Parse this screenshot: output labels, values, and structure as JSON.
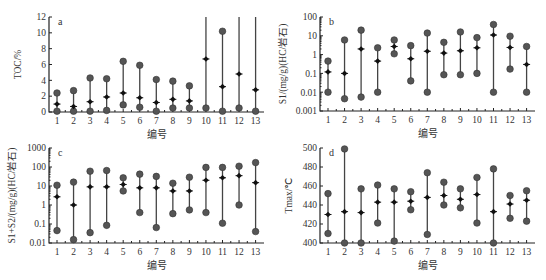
{
  "chart_data": [
    {
      "id": "a",
      "type": "range",
      "panel_letter": "a",
      "title": "",
      "xlabel": "编号",
      "ylabel": "TOC/%",
      "yscale": "linear",
      "ylim": [
        0,
        12
      ],
      "yticks": [
        0,
        2,
        4,
        6,
        8,
        10,
        12
      ],
      "ytick_labels": [
        "0",
        "2",
        "4",
        "6",
        "8",
        "10",
        "12"
      ],
      "categories": [
        "1",
        "2",
        "3",
        "4",
        "5",
        "6",
        "7",
        "8",
        "9",
        "10",
        "11",
        "12",
        "13"
      ],
      "series": [
        {
          "name": "min",
          "values": [
            0.1,
            0.1,
            0.1,
            0.2,
            0.9,
            0.6,
            0.1,
            0.5,
            0.5,
            0.5,
            0.1,
            0.5,
            0.1
          ]
        },
        {
          "name": "mean",
          "values": [
            1.0,
            0.7,
            1.3,
            1.9,
            2.4,
            1.8,
            1.2,
            1.6,
            1.4,
            6.7,
            3.2,
            4.8,
            2.8
          ]
        },
        {
          "name": "max",
          "values": [
            2.4,
            2.7,
            4.3,
            4.2,
            6.4,
            5.9,
            4.1,
            3.9,
            3.3,
            12,
            10.2,
            12,
            12
          ]
        }
      ],
      "grid": false,
      "legend": "none"
    },
    {
      "id": "b",
      "type": "range",
      "panel_letter": "b",
      "title": "",
      "xlabel": "编号",
      "ylabel": "S1/(mg/g)(HC/岩石)",
      "yscale": "log",
      "ylim": [
        0.001,
        100
      ],
      "yticks": [
        0.001,
        0.01,
        0.1,
        1,
        10,
        100
      ],
      "ytick_labels": [
        "0.001",
        "0.01",
        "0.1",
        "1",
        "10",
        "100"
      ],
      "categories": [
        "1",
        "2",
        "3",
        "4",
        "5",
        "6",
        "7",
        "8",
        "9",
        "10",
        "11",
        "12",
        "13"
      ],
      "series": [
        {
          "name": "min",
          "values": [
            0.01,
            0.0045,
            0.0055,
            0.01,
            1.1,
            0.04,
            0.01,
            0.085,
            0.085,
            0.1,
            0.01,
            0.17,
            0.01
          ]
        },
        {
          "name": "mean",
          "values": [
            0.12,
            0.1,
            2.0,
            0.45,
            2.7,
            0.6,
            1.5,
            1.2,
            1.6,
            2.3,
            11,
            2.4,
            0.3
          ]
        },
        {
          "name": "max",
          "values": [
            0.45,
            6.0,
            20,
            2.3,
            6.0,
            3.0,
            14,
            4.5,
            16,
            8.0,
            40,
            9.5,
            2.7
          ]
        }
      ],
      "grid": false,
      "legend": "none"
    },
    {
      "id": "c",
      "type": "range",
      "panel_letter": "c",
      "title": "",
      "xlabel": "编号",
      "ylabel": "S1+S2/(mg/g)(HC/岩石)",
      "yscale": "log",
      "ylim": [
        0.01,
        1000
      ],
      "yticks": [
        0.01,
        0.1,
        1,
        10,
        100,
        1000
      ],
      "ytick_labels": [
        "0.01",
        "0.1",
        "1",
        "10",
        "100",
        "1000"
      ],
      "categories": [
        "1",
        "2",
        "3",
        "4",
        "5",
        "6",
        "7",
        "8",
        "9",
        "10",
        "11",
        "12",
        "13"
      ],
      "series": [
        {
          "name": "min",
          "values": [
            0.045,
            0.015,
            0.035,
            0.085,
            5.5,
            0.4,
            0.065,
            0.35,
            0.55,
            0.4,
            0.11,
            1.0,
            0.04
          ]
        },
        {
          "name": "mean",
          "values": [
            2.7,
            1.0,
            9,
            9,
            12,
            8,
            8,
            5.5,
            5.5,
            20,
            27,
            35,
            15
          ]
        },
        {
          "name": "max",
          "values": [
            11,
            16,
            60,
            65,
            27,
            42,
            32,
            14,
            29,
            95,
            95,
            110,
            170
          ]
        }
      ],
      "grid": false,
      "legend": "none"
    },
    {
      "id": "d",
      "type": "range",
      "panel_letter": "d",
      "title": "",
      "xlabel": "编号",
      "ylabel": "Tmax/℃",
      "yscale": "linear",
      "ylim": [
        400,
        500
      ],
      "yticks": [
        400,
        420,
        440,
        460,
        480,
        500
      ],
      "ytick_labels": [
        "400",
        "420",
        "440",
        "460",
        "480",
        "500"
      ],
      "categories": [
        "1",
        "2",
        "3",
        "4",
        "5",
        "6",
        "7",
        "8",
        "9",
        "10",
        "11",
        "12",
        "13"
      ],
      "series": [
        {
          "name": "min",
          "values": [
            410,
            400,
            400,
            421,
            402,
            435,
            409,
            440,
            437,
            421,
            400,
            426,
            423
          ]
        },
        {
          "name": "mean",
          "values": [
            430,
            433,
            432,
            443,
            443,
            444,
            448,
            450,
            446,
            451,
            433,
            441,
            445
          ]
        },
        {
          "name": "max",
          "values": [
            452,
            499,
            457,
            461,
            457,
            454,
            474,
            464,
            457,
            469,
            478,
            450,
            455
          ]
        }
      ],
      "grid": false,
      "legend": "none"
    }
  ],
  "layout": {
    "panels": {
      "a": {
        "x0": 49,
        "x1": 264,
        "y0": 112,
        "y1": 17,
        "cat_first": 57,
        "cat_step": 16.55
      },
      "b": {
        "x0": 320,
        "x1": 535,
        "y0": 111,
        "y1": 17,
        "cat_first": 328,
        "cat_step": 16.55
      },
      "c": {
        "x0": 49,
        "x1": 264,
        "y0": 243,
        "y1": 148,
        "cat_first": 57,
        "cat_step": 16.55
      },
      "d": {
        "x0": 320,
        "x1": 535,
        "y0": 243,
        "y1": 148,
        "cat_first": 328,
        "cat_step": 16.55
      }
    }
  }
}
